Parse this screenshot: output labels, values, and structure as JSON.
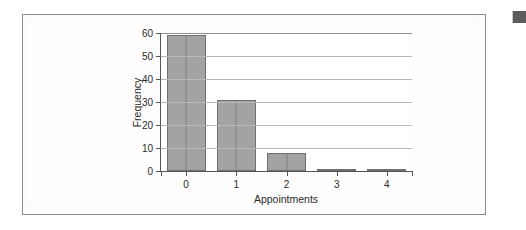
{
  "document": {
    "background_color": "#ffffff",
    "frame_border_color": "#8d8d8d",
    "margin_mark_color": "#5c5c5c"
  },
  "chart_data": {
    "type": "bar",
    "title": "",
    "subtitle": "",
    "xlabel": "Appointments",
    "ylabel": "Frequency",
    "categories": [
      "0",
      "1",
      "2",
      "3",
      "4"
    ],
    "values": [
      59,
      31,
      8,
      1,
      1
    ],
    "series": [
      {
        "name": "Frequency",
        "values": [
          59,
          31,
          8,
          1,
          1
        ]
      }
    ],
    "ylim": [
      0,
      60
    ],
    "ytick_labels": [
      "0",
      "10",
      "20",
      "30",
      "40",
      "50",
      "60"
    ],
    "ytick_values": [
      0,
      10,
      20,
      30,
      40,
      50,
      60
    ],
    "xtick_labels": [
      "0",
      "1",
      "2",
      "3",
      "4"
    ],
    "grid": "horizontal",
    "legend": "none",
    "bar_fill_color": "#a3a3a3",
    "bar_border_color": "#6f6f6f",
    "gridline_color": "#b8b8b8",
    "axis_color": "#565656",
    "plot_background": "#ffffff"
  }
}
